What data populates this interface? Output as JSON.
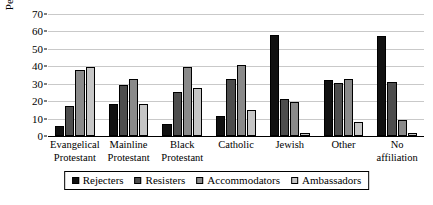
{
  "chart_data": {
    "type": "bar",
    "title": "",
    "subtitle": "",
    "xlabel": "",
    "ylabel": "Percent",
    "ylim": [
      0,
      70
    ],
    "ytick_step": 10,
    "yticks": [
      0,
      10,
      20,
      30,
      40,
      50,
      60,
      70
    ],
    "ytick_labels": [
      "0",
      "10",
      "20",
      "30",
      "40",
      "50",
      "60",
      "70"
    ],
    "grid": true,
    "grid_axis": "y",
    "legend_position": "bottom",
    "categories": [
      "Evangelical Protestant",
      "Mainline Protestant",
      "Black Protestant",
      "Catholic",
      "Jewish",
      "Other",
      "No affiliation"
    ],
    "category_lines": [
      [
        "Evangelical",
        "Protestant"
      ],
      [
        "Mainline",
        "Protestant"
      ],
      [
        "Black",
        "Protestant"
      ],
      [
        "Catholic"
      ],
      [
        "Jewish"
      ],
      [
        "Other"
      ],
      [
        "No",
        "affiliation"
      ]
    ],
    "series": [
      {
        "name": "Rejecters",
        "color": "#111111",
        "values": [
          6,
          18.5,
          7,
          11.5,
          58,
          32,
          57.5
        ]
      },
      {
        "name": "Resisters",
        "color": "#4d4d4d",
        "values": [
          17,
          29.5,
          25.5,
          32.5,
          21,
          30.5,
          31
        ]
      },
      {
        "name": "Accommodators",
        "color": "#8a8a8a",
        "values": [
          38,
          33,
          39.5,
          40.5,
          19.5,
          32.5,
          9
        ]
      },
      {
        "name": "Ambassadors",
        "color": "#c6c6c6",
        "values": [
          39.5,
          18.5,
          27.5,
          15,
          1.5,
          8,
          2
        ]
      }
    ]
  }
}
